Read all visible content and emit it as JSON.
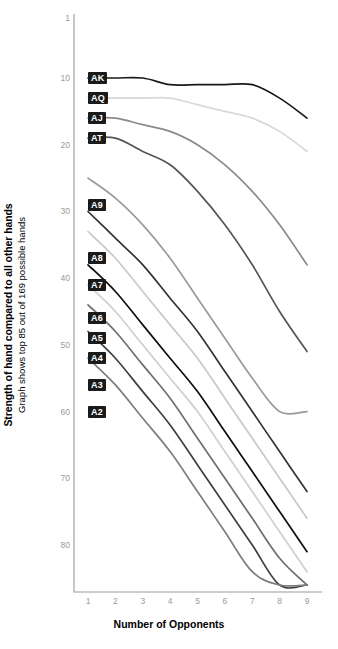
{
  "chart_data": {
    "type": "line",
    "title": "",
    "xlabel": "Number of Opponents",
    "ylabel": "Strength of hand compared to all other hands",
    "ylabel_sub": "Graph shows top 85 out of 169 possible hands",
    "x": [
      1,
      2,
      3,
      4,
      5,
      6,
      7,
      8,
      9
    ],
    "xticks": [
      "1",
      "2",
      "3",
      "4",
      "5",
      "6",
      "7",
      "8",
      "9"
    ],
    "yticks": [
      1,
      10,
      20,
      30,
      40,
      50,
      60,
      70,
      80
    ],
    "ytick_labels": [
      "1",
      "10",
      "20",
      "30",
      "40",
      "50",
      "60",
      "70",
      "80"
    ],
    "ylim": [
      1,
      86
    ],
    "xlim": [
      1,
      9
    ],
    "y_inverted": true,
    "grid": false,
    "legend": "inline-left-labels",
    "series": [
      {
        "name": "AK",
        "color": "#1a1a1a",
        "values": [
          10,
          10,
          10,
          11,
          11,
          11,
          11,
          13,
          16
        ]
      },
      {
        "name": "AQ",
        "color": "#d8d8d8",
        "values": [
          13,
          13,
          13,
          13,
          14,
          15,
          16,
          18,
          21
        ]
      },
      {
        "name": "AJ",
        "color": "#8a8a8a",
        "values": [
          16,
          16,
          17,
          18,
          20,
          23,
          27,
          32,
          38
        ]
      },
      {
        "name": "AT",
        "color": "#555555",
        "values": [
          19,
          19,
          21,
          23,
          27,
          32,
          38,
          45,
          51
        ]
      },
      {
        "name": "A9",
        "color": "#9a9a9a",
        "values": [
          25,
          28,
          32,
          37,
          43,
          49,
          55,
          60,
          60
        ]
      },
      {
        "name": "A8",
        "color": "#333333",
        "values": [
          30,
          34,
          38,
          43,
          48,
          54,
          60,
          66,
          72
        ]
      },
      {
        "name": "A7",
        "color": "#c8c8c8",
        "values": [
          33,
          37,
          42,
          47,
          52,
          58,
          64,
          70,
          76
        ]
      },
      {
        "name": "A6",
        "color": "#0d0d0d",
        "values": [
          38,
          42,
          47,
          52,
          57,
          63,
          69,
          75,
          81
        ]
      },
      {
        "name": "A5",
        "color": "#cfcfcf",
        "values": [
          41,
          45,
          50,
          55,
          60,
          66,
          72,
          78,
          84
        ]
      },
      {
        "name": "A4",
        "color": "#6e6e6e",
        "values": [
          44,
          48,
          53,
          58,
          64,
          70,
          76,
          82,
          86
        ]
      },
      {
        "name": "A3",
        "color": "#3f3f3f",
        "values": [
          48,
          52,
          57,
          62,
          68,
          74,
          80,
          86,
          86
        ]
      },
      {
        "name": "A2",
        "color": "#7d7d7d",
        "values": [
          52,
          56,
          61,
          66,
          72,
          78,
          84,
          86,
          86
        ]
      }
    ],
    "hand_labels": [
      {
        "name": "AK",
        "y": 10
      },
      {
        "name": "AQ",
        "y": 13
      },
      {
        "name": "AJ",
        "y": 16
      },
      {
        "name": "AT",
        "y": 19
      },
      {
        "name": "A9",
        "y": 29
      },
      {
        "name": "A8",
        "y": 37
      },
      {
        "name": "A7",
        "y": 41
      },
      {
        "name": "A6",
        "y": 46
      },
      {
        "name": "A5",
        "y": 49
      },
      {
        "name": "A4",
        "y": 52
      },
      {
        "name": "A3",
        "y": 56
      },
      {
        "name": "A2",
        "y": 60
      }
    ]
  },
  "axis": {
    "line_color": "#999999",
    "tick_text_color": "#9a9a9a"
  }
}
